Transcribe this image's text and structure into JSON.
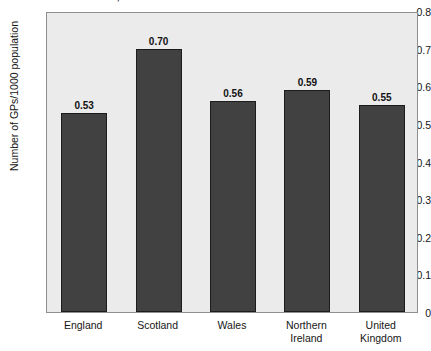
{
  "chart_data": {
    "type": "bar",
    "title": "countries, 2003",
    "title_note": "title is cropped off the top edge of the screenshot",
    "xlabel": "",
    "ylabel": "Number of GPs/1000 population",
    "categories": [
      "England",
      "Scotland",
      "Wales",
      "Northern Ireland",
      "United Kingdom"
    ],
    "values": [
      0.53,
      0.7,
      0.56,
      0.59,
      0.55
    ],
    "value_labels": [
      "0.53",
      "0.70",
      "0.56",
      "0.59",
      "0.55"
    ],
    "ylim": [
      0,
      0.8
    ],
    "ytick_values": [
      0,
      0.1,
      0.2,
      0.3,
      0.4,
      0.5,
      0.6,
      0.7,
      0.8
    ],
    "ytick_labels": [
      "0",
      "0.1",
      "0.2",
      "0.3",
      "0.4",
      "0.5",
      "0.6",
      "0.7",
      "0.8"
    ],
    "grid": false,
    "legend": null,
    "series": [
      {
        "name": "Number of GPs/1000 population",
        "values": [
          0.53,
          0.7,
          0.56,
          0.59,
          0.55
        ]
      }
    ],
    "colors": {
      "bar_fill": "#414141",
      "bar_edge": "#1c1c1c",
      "plot_background": "#ebebeb",
      "figure_background": "#ffffff",
      "axis": "#8e8e8e",
      "text": "#161616"
    }
  }
}
